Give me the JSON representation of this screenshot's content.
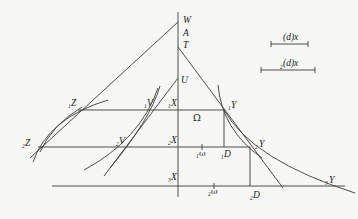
{
  "diagram": {
    "labels": {
      "W": "W",
      "A": "A",
      "T": "T",
      "U": "U",
      "Z1": {
        "sub": "1",
        "main": "Z"
      },
      "V1": {
        "sub": "1",
        "main": "V"
      },
      "X1": {
        "sub": "1",
        "main": "X"
      },
      "Y1": {
        "sub": "1",
        "main": "Y"
      },
      "Omega": "Ω",
      "Z2": {
        "sub": "2",
        "main": "Z"
      },
      "V2": {
        "sub": "2",
        "main": "V"
      },
      "X2": {
        "sub": "2",
        "main": "X"
      },
      "Y2": {
        "sub": "2",
        "main": "Y"
      },
      "omega1": {
        "sub": "1",
        "main": "ω"
      },
      "D1": {
        "sub": "1",
        "main": "D"
      },
      "X3": {
        "sub": "3",
        "main": "X"
      },
      "omega2": {
        "sub": "2",
        "main": "ω"
      },
      "D2": {
        "sub": "2",
        "main": "D"
      },
      "Y3": {
        "sub": "3",
        "main": "Y"
      }
    },
    "legend": {
      "scale1": {
        "label": "(d)x"
      },
      "scale2": {
        "sub": "2",
        "label": "(d)x"
      }
    }
  }
}
